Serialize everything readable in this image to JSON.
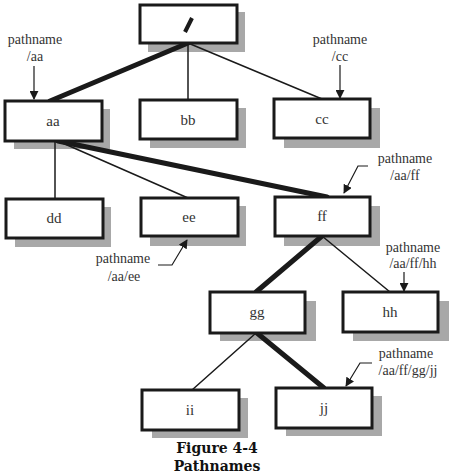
{
  "figure": {
    "title": "Figure 4-4",
    "subtitle": "Pathnames"
  },
  "nodes": {
    "root": "/",
    "aa": "aa",
    "bb": "bb",
    "cc": "cc",
    "dd": "dd",
    "ee": "ee",
    "ff": "ff",
    "gg": "gg",
    "hh": "hh",
    "ii": "ii",
    "jj": "jj"
  },
  "annotations": {
    "aa": {
      "label": "pathname",
      "path": "/aa"
    },
    "cc": {
      "label": "pathname",
      "path": "/cc"
    },
    "ee": {
      "label": "pathname",
      "path": "/aa/ee"
    },
    "ff": {
      "label": "pathname",
      "path": "/aa/ff"
    },
    "hh": {
      "label": "pathname",
      "path": "/aa/ff/hh"
    },
    "jj": {
      "label": "pathname",
      "path": "/aa/ff/gg/jj"
    }
  },
  "edges": [
    {
      "from": "/",
      "to": "aa",
      "highlighted": true
    },
    {
      "from": "/",
      "to": "bb",
      "highlighted": false
    },
    {
      "from": "/",
      "to": "cc",
      "highlighted": false
    },
    {
      "from": "aa",
      "to": "dd",
      "highlighted": false
    },
    {
      "from": "aa",
      "to": "ee",
      "highlighted": false
    },
    {
      "from": "aa",
      "to": "ff",
      "highlighted": true
    },
    {
      "from": "ff",
      "to": "gg",
      "highlighted": true
    },
    {
      "from": "ff",
      "to": "hh",
      "highlighted": false
    },
    {
      "from": "gg",
      "to": "ii",
      "highlighted": false
    },
    {
      "from": "gg",
      "to": "jj",
      "highlighted": true
    }
  ],
  "colors": {
    "box_border": "#1a1a1a",
    "shadow": "#a8a8a8",
    "line": "#1a1a1a"
  }
}
